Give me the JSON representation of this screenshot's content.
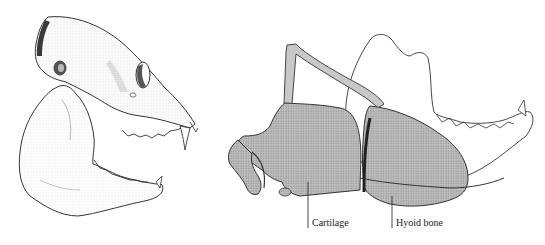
{
  "figure": {
    "left_panel": {
      "subject": "primate skull with open jaw (lateral view)"
    },
    "right_panel": {
      "subject": "hyoid apparatus and laryngeal cartilage with mandible outline",
      "labels": [
        {
          "id": "cartilage",
          "text": "Cartilage"
        },
        {
          "id": "hyoid",
          "text": "Hyoid bone"
        }
      ]
    }
  },
  "colors": {
    "ink": "#2a2a2a",
    "stipple_fill": "#b8b8b8",
    "stipple_dark": "#9a9a9a",
    "background": "#ffffff"
  }
}
